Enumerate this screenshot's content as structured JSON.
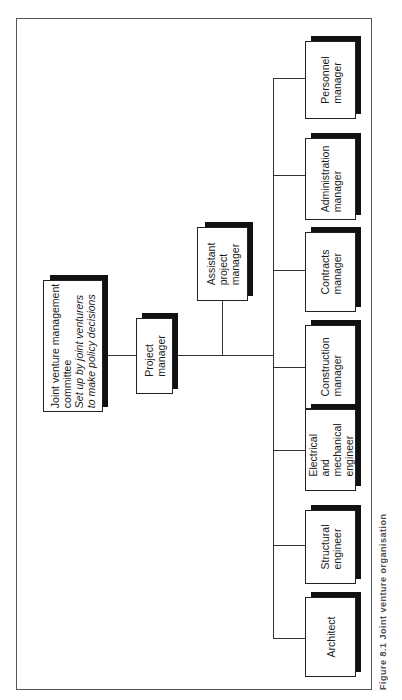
{
  "diagram": {
    "orientation": "rotated-90-ccw",
    "root": {
      "title_lines": [
        "Joint venture management",
        "committee"
      ],
      "subtitle_lines": [
        "Set up by joint venturers",
        "to make policy decisions"
      ]
    },
    "project_manager": {
      "lines": [
        "Project",
        "manager"
      ]
    },
    "assistant_project_manager": {
      "lines": [
        "Assistant",
        "project",
        "manager"
      ]
    },
    "departments": [
      {
        "id": "architect",
        "lines": [
          "Architect"
        ]
      },
      {
        "id": "structural-engineer",
        "lines": [
          "Structural",
          "engineer"
        ]
      },
      {
        "id": "electrical-mechanical-engineer",
        "lines": [
          "Electrical",
          "and",
          "mechanical",
          "engineer"
        ]
      },
      {
        "id": "construction-manager",
        "lines": [
          "Construction",
          "manager"
        ]
      },
      {
        "id": "contracts-manager",
        "lines": [
          "Contracts",
          "manager"
        ]
      },
      {
        "id": "administration-manager",
        "lines": [
          "Administration",
          "manager"
        ]
      },
      {
        "id": "personnel-manager",
        "lines": [
          "Personnel",
          "manager"
        ]
      }
    ],
    "caption": "Figure 8.1 Joint venture organisation"
  }
}
